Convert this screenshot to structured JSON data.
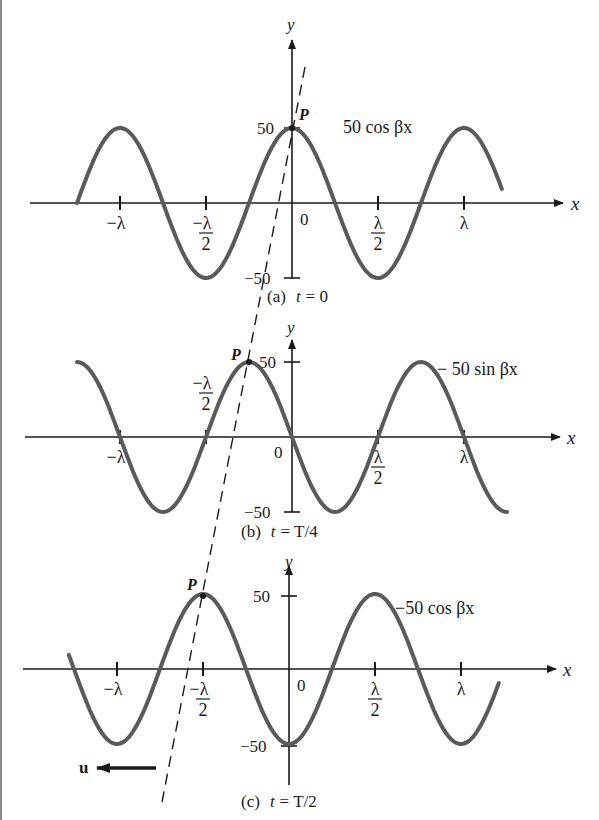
{
  "figure": {
    "dashed_line": {
      "from": [
        305,
        67
      ],
      "to": [
        162,
        802
      ],
      "color": "#1a1a1a"
    },
    "velocity": {
      "label": "u",
      "direction": "left"
    },
    "curve_color": "#5a5a5a",
    "axis_color": "#1a1a1a"
  },
  "panels": [
    {
      "id": "a",
      "caption_prefix": "(a)",
      "caption_var": "t",
      "caption_value": "= 0",
      "curve_label": "50 cos βx",
      "point_label": "P",
      "y_label": "y",
      "x_label": "x",
      "y_ticks": {
        "pos": "50",
        "neg": "−50"
      },
      "origin_label": "0",
      "x_ticks": [
        {
          "frac": -1.0,
          "num": "−λ",
          "den": ""
        },
        {
          "frac": -0.5,
          "num": "−λ",
          "den": "2"
        },
        {
          "frac": 0.5,
          "num": "λ",
          "den": "2"
        },
        {
          "frac": 1.0,
          "num": "λ",
          "den": ""
        }
      ]
    },
    {
      "id": "b",
      "caption_prefix": "(b)",
      "caption_var": "t",
      "caption_value": "= T/4",
      "curve_label": "− 50 sin βx",
      "point_label": "P",
      "y_label": "y",
      "x_label": "x",
      "y_ticks": {
        "pos": "50",
        "neg": "−50"
      },
      "origin_label": "0",
      "x_ticks": [
        {
          "frac": -1.0,
          "num": "−λ",
          "den": ""
        },
        {
          "frac": -0.5,
          "num": "−λ",
          "den": "2"
        },
        {
          "frac": 0.5,
          "num": "λ",
          "den": "2"
        },
        {
          "frac": 1.0,
          "num": "λ",
          "den": ""
        }
      ]
    },
    {
      "id": "c",
      "caption_prefix": "(c)",
      "caption_var": "t",
      "caption_value": "= T/2",
      "curve_label": "−50 cos βx",
      "point_label": "P",
      "y_label": "y",
      "x_label": "x",
      "y_ticks": {
        "pos": "50",
        "neg": "−50"
      },
      "origin_label": "0",
      "x_ticks": [
        {
          "frac": -1.0,
          "num": "−λ",
          "den": ""
        },
        {
          "frac": -0.5,
          "num": "−λ",
          "den": "2"
        },
        {
          "frac": 0.5,
          "num": "λ",
          "den": "2"
        },
        {
          "frac": 1.0,
          "num": "λ",
          "den": ""
        }
      ]
    }
  ],
  "chart_data": {
    "type": "line",
    "xlabel": "x",
    "ylabel": "y",
    "ylim": [
      -50,
      50
    ],
    "x_unit": "λ",
    "x_ticks": [
      "−λ",
      "−λ/2",
      "0",
      "λ/2",
      "λ"
    ],
    "y_ticks": [
      -50,
      50
    ],
    "series": [
      {
        "name": "50 cos βx",
        "panel": "(a) t = 0",
        "function": "50*cos(2*pi*x)",
        "x_range": [
          -1.25,
          1.22
        ],
        "points": [
          [
            -1.0,
            50
          ],
          [
            -0.75,
            0
          ],
          [
            -0.5,
            -50
          ],
          [
            -0.25,
            0
          ],
          [
            0,
            50
          ],
          [
            0.25,
            0
          ],
          [
            0.5,
            -50
          ],
          [
            0.75,
            0
          ],
          [
            1.0,
            50
          ]
        ]
      },
      {
        "name": "− 50 sin βx",
        "panel": "(b) t = T/4",
        "function": "-50*sin(2*pi*x)",
        "x_range": [
          -1.25,
          1.25
        ],
        "points": [
          [
            -1.0,
            0
          ],
          [
            -0.75,
            -50
          ],
          [
            -0.5,
            0
          ],
          [
            -0.25,
            50
          ],
          [
            0,
            0
          ],
          [
            0.25,
            -50
          ],
          [
            0.5,
            0
          ],
          [
            0.75,
            50
          ],
          [
            1.0,
            0
          ]
        ]
      },
      {
        "name": "−50 cos βx",
        "panel": "(c) t = T/2",
        "function": "-50*cos(2*pi*x)",
        "x_range": [
          -1.28,
          1.22
        ],
        "points": [
          [
            -1.0,
            -50
          ],
          [
            -0.75,
            0
          ],
          [
            -0.5,
            50
          ],
          [
            -0.25,
            0
          ],
          [
            0,
            -50
          ],
          [
            0.25,
            0
          ],
          [
            0.5,
            50
          ],
          [
            0.75,
            0
          ],
          [
            1.0,
            -50
          ]
        ]
      }
    ],
    "annotations": [
      {
        "text": "P",
        "panel": "a",
        "x": 0,
        "y": 50
      },
      {
        "text": "P",
        "panel": "b",
        "x": -0.25,
        "y": 50
      },
      {
        "text": "P",
        "panel": "c",
        "x": -0.5,
        "y": 50
      },
      {
        "text": "u ←",
        "meaning": "wave velocity, direction −x"
      }
    ],
    "grid": false,
    "legend": "none (inline curve labels)"
  }
}
